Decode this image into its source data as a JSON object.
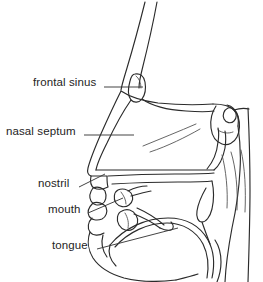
{
  "figure": {
    "type": "anatomical-line-diagram",
    "background_color": "#ffffff",
    "line_color": "#2b2b2b",
    "text_color": "#242424"
  },
  "labels": [
    {
      "id": "frontal-sinus",
      "text": "frontal sinus",
      "leader": {
        "x1": 104,
        "y1": 87,
        "x2": 143,
        "y2": 87
      }
    },
    {
      "id": "nasal-septum",
      "text": "nasal septum",
      "leader": {
        "x1": 84,
        "y1": 135,
        "x2": 134,
        "y2": 135
      }
    },
    {
      "id": "nostril",
      "text": "nostril",
      "leader": {
        "x1": 79,
        "y1": 187,
        "x2": 105,
        "y2": 174
      }
    },
    {
      "id": "mouth",
      "text": "mouth",
      "leader": {
        "x1": 88,
        "y1": 213,
        "x2": 123,
        "y2": 198
      }
    },
    {
      "id": "tongue",
      "text": "tongue",
      "leader": {
        "x1": 97,
        "y1": 249,
        "x2": 178,
        "y2": 228
      }
    }
  ],
  "structures": [
    "nose-bridge",
    "frontal-sinus-pocket",
    "nasal-cavity",
    "nasal-septum-surface",
    "turbinate-shading",
    "sphenoid-sinus",
    "nostril-opening",
    "upper-teeth",
    "lower-teeth",
    "lips",
    "hard-palate",
    "soft-palate-uvula",
    "tongue-body",
    "pharynx-wall",
    "chin-outline",
    "neck-outline"
  ]
}
